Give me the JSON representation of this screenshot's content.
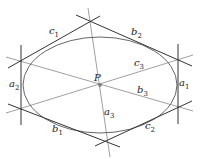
{
  "diagram": {
    "title": "",
    "center_label": "P",
    "ellipse": {
      "cx": 100,
      "cy": 85,
      "rx": 77,
      "ry": 48
    },
    "vertices": {
      "top": [
        90,
        21
      ],
      "right_top": [
        178,
        60
      ],
      "right_bottom": [
        178,
        108
      ],
      "bottom": [
        107,
        141
      ],
      "left_bottom": [
        21,
        109
      ],
      "left_top": [
        21,
        61
      ]
    },
    "labels": [
      {
        "id": "c1",
        "base": "c",
        "sub": "1",
        "x": 49,
        "y": 26
      },
      {
        "id": "b2",
        "base": "b",
        "sub": "2",
        "x": 131,
        "y": 27
      },
      {
        "id": "c3",
        "base": "c",
        "sub": "3",
        "x": 134,
        "y": 58
      },
      {
        "id": "a2",
        "base": "a",
        "sub": "2",
        "x": 9,
        "y": 79
      },
      {
        "id": "a1",
        "base": "a",
        "sub": "1",
        "x": 179,
        "y": 78
      },
      {
        "id": "b3",
        "base": "b",
        "sub": "3",
        "x": 137,
        "y": 85
      },
      {
        "id": "a3",
        "base": "a",
        "sub": "3",
        "x": 104,
        "y": 107
      },
      {
        "id": "b1",
        "base": "b",
        "sub": "1",
        "x": 52,
        "y": 124
      },
      {
        "id": "c2",
        "base": "c",
        "sub": "2",
        "x": 145,
        "y": 121
      }
    ],
    "colors": {
      "line": "#333333",
      "diagonal": "#888888",
      "text": "#222222"
    }
  }
}
